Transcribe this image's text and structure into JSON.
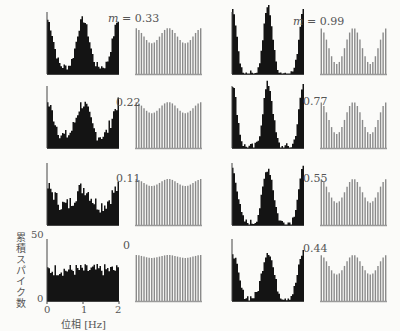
{
  "chart_data": {
    "type": "bar",
    "ylabel": "累積スパイク数",
    "xlabel": "位相 [Hz]",
    "x_ticks": [
      "0",
      "1",
      "2"
    ],
    "y_ticks": [
      "0",
      "50"
    ],
    "xlim": [
      0,
      2
    ],
    "ylim": [
      0,
      50
    ],
    "panels": [
      {
        "col": 0,
        "row": 0,
        "m_label": "m = 0.33",
        "m": 0.33,
        "peak": 44,
        "trough": 6,
        "noise": 3
      },
      {
        "col": 0,
        "row": 1,
        "m_label": "0.22",
        "m": 0.22,
        "peak": 36,
        "trough": 10,
        "noise": 5
      },
      {
        "col": 0,
        "row": 2,
        "m_label": "0.11",
        "m": 0.11,
        "peak": 30,
        "trough": 16,
        "noise": 6
      },
      {
        "col": 0,
        "row": 3,
        "m_label": "0",
        "m": 0,
        "peak": 25,
        "trough": 25,
        "noise": 5
      },
      {
        "col": 1,
        "row": 0,
        "m_label": "m = 0.99",
        "m": 0.99,
        "peak": 55,
        "trough": 1,
        "noise": 2
      },
      {
        "col": 1,
        "row": 1,
        "m_label": "0.77",
        "m": 0.77,
        "peak": 52,
        "trough": 1,
        "noise": 3
      },
      {
        "col": 1,
        "row": 2,
        "m_label": "0.55",
        "m": 0.55,
        "peak": 46,
        "trough": 2,
        "noise": 3
      },
      {
        "col": 1,
        "row": 3,
        "m_label": "0.44",
        "m": 0.44,
        "peak": 40,
        "trough": 3,
        "noise": 3
      }
    ]
  },
  "labels": {
    "ylabel": "累積スパイク数",
    "xlabel": "位相 [Hz]",
    "ytick_top": "50",
    "ytick_bottom": "0",
    "xtick_0": "0",
    "xtick_1": "1",
    "xtick_2": "2",
    "m_prefix": "m",
    "panel_labels": [
      "= 0.33",
      "0.22",
      "0.11",
      "0",
      "= 0.99",
      "0.77",
      "0.55",
      "0.44"
    ]
  },
  "colors": {
    "histogram": "#141414",
    "spikes": "#8a8a8a",
    "axis": "#444444",
    "text": "#555555",
    "background": "#fbfbf9"
  }
}
